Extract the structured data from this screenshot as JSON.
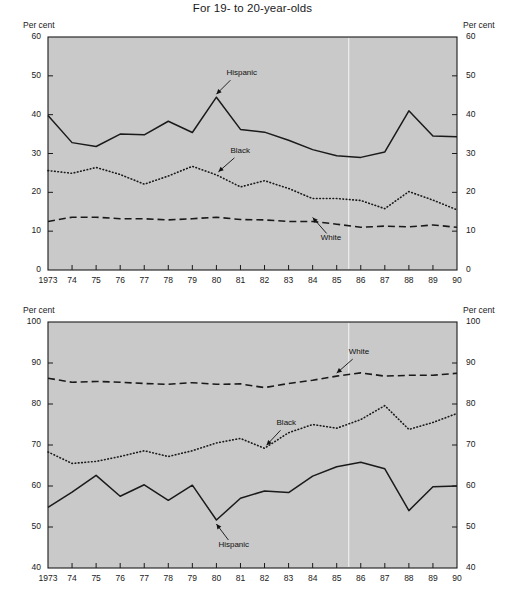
{
  "figure": {
    "title": "For 19- to 20-year-olds"
  },
  "axis_unit": {
    "left": "Per cent",
    "right": "Per cent"
  },
  "chart_data": [
    {
      "type": "line",
      "title": "Dropout rate",
      "xlabel": "",
      "ylabel": "Per cent",
      "ylim": [
        0,
        60
      ],
      "xlim": [
        1973,
        1990
      ],
      "yticks": [
        0,
        10,
        20,
        30,
        40,
        50,
        60
      ],
      "ytick_labels": [
        "0",
        "10",
        "20",
        "30",
        "40",
        "50",
        "60"
      ],
      "grid": false,
      "legend": "inline-annotations",
      "x": [
        1973,
        1974,
        1975,
        1976,
        1977,
        1978,
        1979,
        1980,
        1981,
        1982,
        1983,
        1984,
        1985,
        1986,
        1987,
        1988,
        1989,
        1990
      ],
      "categories": [
        "1973",
        "74",
        "75",
        "76",
        "77",
        "78",
        "79",
        "80",
        "81",
        "82",
        "83",
        "84",
        "85",
        "86",
        "87",
        "88",
        "89",
        "90"
      ],
      "series": [
        {
          "name": "Hispanic",
          "style": "solid",
          "values": [
            39.8,
            32.8,
            31.8,
            35.0,
            34.8,
            38.3,
            35.4,
            44.5,
            36.2,
            35.5,
            33.4,
            31.0,
            29.4,
            29.0,
            30.4,
            41.0,
            34.5,
            34.3
          ]
        },
        {
          "name": "Black",
          "style": "dotted",
          "values": [
            25.6,
            24.9,
            26.4,
            24.6,
            22.1,
            24.2,
            26.7,
            24.5,
            21.4,
            23.0,
            21.0,
            18.4,
            18.4,
            17.9,
            15.8,
            20.2,
            18.0,
            15.5
          ]
        },
        {
          "name": "White",
          "style": "dashed",
          "values": [
            12.5,
            13.6,
            13.6,
            13.2,
            13.2,
            12.9,
            13.2,
            13.6,
            13.0,
            12.9,
            12.5,
            12.5,
            11.8,
            11.0,
            11.3,
            11.1,
            11.6,
            11.0
          ]
        }
      ],
      "annotations": [
        {
          "text": "Hispanic",
          "series": "Hispanic",
          "points_to_year": 1980
        },
        {
          "text": "Black",
          "series": "Black",
          "points_to_year": 1980
        },
        {
          "text": "White",
          "series": "White",
          "points_to_year": 1984
        }
      ]
    },
    {
      "type": "line",
      "title": "High school completion rate",
      "xlabel": "",
      "ylabel": "Per cent",
      "ylim": [
        40,
        100
      ],
      "xlim": [
        1973,
        1990
      ],
      "yticks": [
        40,
        50,
        60,
        70,
        80,
        90,
        100
      ],
      "ytick_labels": [
        "40",
        "50",
        "60",
        "70",
        "80",
        "90",
        "100"
      ],
      "grid": false,
      "legend": "inline-annotations",
      "x": [
        1973,
        1974,
        1975,
        1976,
        1977,
        1978,
        1979,
        1980,
        1981,
        1982,
        1983,
        1984,
        1985,
        1986,
        1987,
        1988,
        1989,
        1990
      ],
      "categories": [
        "1973",
        "74",
        "75",
        "76",
        "77",
        "78",
        "79",
        "80",
        "81",
        "82",
        "83",
        "84",
        "85",
        "86",
        "87",
        "88",
        "89",
        "90"
      ],
      "series": [
        {
          "name": "White",
          "style": "dashed",
          "values": [
            86.3,
            85.3,
            85.5,
            85.3,
            85.0,
            84.8,
            85.2,
            84.8,
            84.9,
            84.0,
            85.0,
            85.8,
            86.8,
            87.6,
            86.8,
            87.0,
            87.0,
            87.5
          ]
        },
        {
          "name": "Black",
          "style": "dotted",
          "values": [
            68.3,
            65.5,
            66.0,
            67.2,
            68.6,
            67.2,
            68.6,
            70.5,
            71.6,
            69.2,
            73.0,
            75.0,
            74.1,
            76.2,
            79.6,
            73.8,
            75.5,
            77.7
          ]
        },
        {
          "name": "Hispanic",
          "style": "solid",
          "values": [
            54.8,
            58.5,
            62.6,
            57.5,
            60.3,
            56.5,
            60.2,
            51.7,
            57.0,
            58.8,
            58.4,
            62.4,
            64.7,
            65.8,
            64.2,
            54.0,
            59.8,
            60.0
          ]
        }
      ],
      "annotations": [
        {
          "text": "White",
          "series": "White",
          "points_to_year": 1985
        },
        {
          "text": "Black",
          "series": "Black",
          "points_to_year": 1982
        },
        {
          "text": "Hispanic",
          "series": "Hispanic",
          "points_to_year": 1980
        }
      ]
    }
  ]
}
